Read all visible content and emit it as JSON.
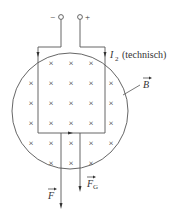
{
  "terminals": {
    "minus": "−",
    "plus": "+"
  },
  "labels": {
    "current": "I",
    "current_sub": "2",
    "current_note": "(technisch)",
    "field": "B",
    "force": "F",
    "gravity": "F",
    "gravity_sub": "G"
  },
  "field_symbol": "×",
  "colors": {
    "line": "#555555",
    "text": "#333333"
  }
}
